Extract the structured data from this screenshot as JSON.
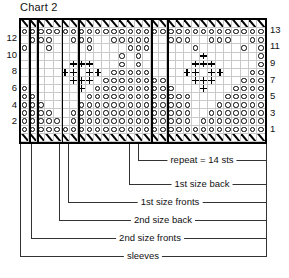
{
  "title": "Chart 2",
  "chart_data": {
    "type": "table",
    "title": "Chart 2",
    "columns": 30,
    "rows": 15,
    "row_labels_left": [
      "12",
      "10",
      "8",
      "6",
      "4",
      "2"
    ],
    "row_labels_right": [
      "13",
      "11",
      "9",
      "7",
      "5",
      "3",
      "1"
    ],
    "symbol_legend": {
      "o": "circle-stitch",
      "p": "plus-stitch",
      "s": "slash-stitch",
      ".": "blank-stitch"
    },
    "grid": [
      "ssssssssssssssssssssssssssssss",
      "oooooooooooooooooooooooooooooo",
      ".ooo..ooo..ooooo..ooo..ooo..oo",
      "o..o....o....ooo.....o.....o.o",
      "............o.o.......p......o",
      "......ppp...o.o......ppp.....o",
      ".....pp.pp.ooooo....pp.pp...oo",
      "......ppp.oooooooo...ppp...ooo",
      "o......p.oooooooooo...p...oooo",
      "oo......ooooooooooooo....ooooo",
      "ooo....oooooooooooooo...oooooo",
      "oooo..ooooooooooooooo..ooooooo",
      "ooooo.ooooooooooooooo.oooooooo",
      "oooooooooooooooooooooooooooooo",
      "ssssssssssssssssssssssssssssss"
    ],
    "section_divider_columns": [
      1,
      2,
      5,
      7,
      16,
      18
    ]
  },
  "legend": {
    "items": [
      {
        "label": "repeat = 14 sts"
      },
      {
        "label": "1st size back"
      },
      {
        "label": "1st size fronts"
      },
      {
        "label": "2nd size back"
      },
      {
        "label": "2nd size fronts"
      },
      {
        "label": "sleeves"
      }
    ]
  }
}
